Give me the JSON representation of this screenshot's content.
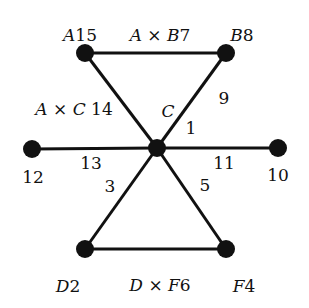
{
  "diagram": {
    "type": "graph",
    "colors": {
      "edge": "#111111",
      "node": "#111111",
      "text": "#111111",
      "background": "#ffffff"
    },
    "nodes": [
      {
        "id": "center",
        "x": 157,
        "y": 148,
        "r": 9
      },
      {
        "id": "A",
        "x": 85,
        "y": 53,
        "r": 9
      },
      {
        "id": "B",
        "x": 226,
        "y": 53,
        "r": 9
      },
      {
        "id": "left",
        "x": 32,
        "y": 149,
        "r": 9
      },
      {
        "id": "right",
        "x": 278,
        "y": 148,
        "r": 9
      },
      {
        "id": "D",
        "x": 85,
        "y": 249,
        "r": 9
      },
      {
        "id": "F",
        "x": 226,
        "y": 249,
        "r": 9
      }
    ],
    "edges": [
      [
        "A",
        "B"
      ],
      [
        "A",
        "center"
      ],
      [
        "B",
        "center"
      ],
      [
        "left",
        "center"
      ],
      [
        "center",
        "right"
      ],
      [
        "center",
        "D"
      ],
      [
        "center",
        "F"
      ],
      [
        "D",
        "F"
      ]
    ],
    "labels": {
      "node_A": {
        "var": "A",
        "num": "15",
        "x": 80,
        "y": 35
      },
      "node_B": {
        "var": "B",
        "num": "8",
        "x": 242,
        "y": 35
      },
      "node_D": {
        "var": "D",
        "num": "2",
        "x": 68,
        "y": 286
      },
      "node_F": {
        "var": "F",
        "num": "4",
        "x": 244,
        "y": 286
      },
      "edge_AB": {
        "a": "A",
        "op": "×",
        "b": "B",
        "num": "7",
        "x": 160,
        "y": 35
      },
      "edge_DF": {
        "a": "D",
        "op": "×",
        "b": "F",
        "num": "6",
        "x": 160,
        "y": 285
      },
      "edge_AC": {
        "a": "A",
        "op": "×",
        "b": "C",
        "num": "14",
        "x": 74,
        "y": 109
      },
      "center_C": {
        "var": "C",
        "x": 168,
        "y": 111
      },
      "w1": {
        "num": "1",
        "x": 191,
        "y": 128
      },
      "w9": {
        "num": "9",
        "x": 224,
        "y": 98
      },
      "w13": {
        "num": "13",
        "x": 91,
        "y": 163
      },
      "w3": {
        "num": "3",
        "x": 110,
        "y": 186
      },
      "w11": {
        "num": "11",
        "x": 224,
        "y": 163
      },
      "w5": {
        "num": "5",
        "x": 205,
        "y": 185
      },
      "w12": {
        "num": "12",
        "x": 33,
        "y": 177
      },
      "w10": {
        "num": "10",
        "x": 278,
        "y": 175
      }
    }
  }
}
